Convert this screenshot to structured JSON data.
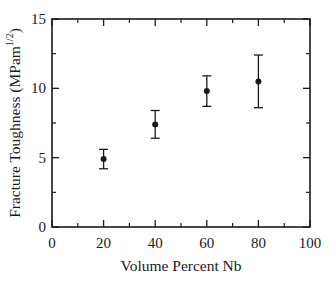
{
  "figure": {
    "background": "#ffffff",
    "ink_color": "#1a1a1a"
  },
  "chart_data": {
    "type": "scatter",
    "title": "",
    "xlabel": "Volume Percent Nb",
    "ylabel": {
      "prefix": "Fracture Toughness (MPam",
      "sup": "1/2",
      "suffix": ")"
    },
    "x": [
      20,
      40,
      60,
      80
    ],
    "y": [
      4.9,
      7.4,
      9.8,
      10.5
    ],
    "yerr": [
      0.7,
      1.0,
      1.1,
      1.9
    ],
    "xlim": [
      0,
      100
    ],
    "ylim": [
      0,
      15
    ],
    "xtick_labels": [
      "0",
      "20",
      "40",
      "60",
      "80",
      "100"
    ],
    "xticks": [
      0,
      20,
      40,
      60,
      80,
      100
    ],
    "xminor": [
      10,
      30,
      50,
      70,
      90
    ],
    "ytick_labels": [
      "0",
      "5",
      "10",
      "15"
    ],
    "yticks": [
      0,
      5,
      10,
      15
    ],
    "yminor": [
      2.5,
      7.5,
      12.5
    ],
    "marker": "filled-circle",
    "error_bars": true,
    "grid": false,
    "legend": false
  }
}
